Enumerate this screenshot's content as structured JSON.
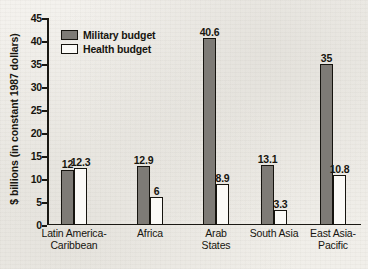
{
  "chart_data": {
    "type": "bar",
    "title": "",
    "subtitle": "",
    "xlabel": "",
    "ylabel": "$ billions (in constant 1987 dollars)",
    "ylim": [
      0,
      45
    ],
    "ytick_step": 5,
    "yticks": [
      "45",
      "40",
      "35",
      "30",
      "25",
      "20",
      "15",
      "10",
      "5",
      "0"
    ],
    "grid": false,
    "legend_position": "top-left",
    "categories": [
      "Latin America-Caribbean",
      "Africa",
      "Arab States",
      "South Asia",
      "East Asia-Pacific"
    ],
    "category_lines": [
      [
        "Latin America-",
        "Caribbean"
      ],
      [
        "Africa"
      ],
      [
        "Arab",
        "States"
      ],
      [
        "South Asia"
      ],
      [
        "East Asia-",
        "Pacific"
      ]
    ],
    "series": [
      {
        "name": "Military budget",
        "color": "#7e7b76",
        "values": [
          12,
          12.9,
          40.6,
          13.1,
          35
        ],
        "labels": [
          "12",
          "12.9",
          "40.6",
          "13.1",
          "35"
        ]
      },
      {
        "name": "Health budget",
        "color": "#fbfaf7",
        "values": [
          12.3,
          6,
          8.9,
          3.3,
          10.8
        ],
        "labels": [
          "12.3",
          "6",
          "8.9",
          "3.3",
          "10.8"
        ]
      }
    ]
  },
  "legend": {
    "items": [
      {
        "label": "Military budget",
        "swatch": "military"
      },
      {
        "label": "Health budget",
        "swatch": "health"
      }
    ]
  },
  "colors": {
    "military_fill": "#7e7b76",
    "health_fill": "#fbfaf7",
    "outline": "#16140f",
    "paper": "#f2f0ec",
    "text": "#17150f"
  }
}
